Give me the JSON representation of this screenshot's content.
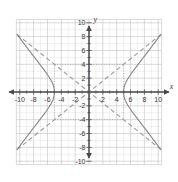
{
  "figure": {
    "kind": "coordinate-plane-graph",
    "background_color": "#ffffff",
    "grid_minor_color": "#e2e2e2",
    "grid_major_color": "#c9c9c9",
    "axis_color": "#4a4a4a",
    "curve_color": "#8a8a8a",
    "asymptote_color": "#9a9a9a",
    "box_color": "#9a9a9a"
  },
  "axes": {
    "x_axis_label": "x",
    "y_axis_label": "y",
    "x_min": -10.5,
    "x_max": 10.5,
    "y_min": -10.5,
    "y_max": 10.5,
    "x_tick_labels": [
      "-10",
      "-8",
      "-6",
      "-4",
      "-2",
      "2",
      "4",
      "6",
      "8",
      "10"
    ],
    "x_tick_values": [
      -10,
      -8,
      -6,
      -4,
      -2,
      2,
      4,
      6,
      8,
      10
    ],
    "y_tick_labels": [
      "10",
      "8",
      "6",
      "4",
      "2",
      "-2",
      "-4",
      "-6",
      "-8",
      "-10"
    ],
    "y_tick_values": [
      10,
      8,
      6,
      4,
      2,
      -2,
      -4,
      -6,
      -8,
      -10
    ],
    "tick_step": 2,
    "grid_step": 1,
    "arrowheads": [
      "left",
      "right",
      "up",
      "down"
    ]
  },
  "chart_data": {
    "type": "line",
    "title": "",
    "xlabel": "x",
    "ylabel": "y",
    "xlim": [
      -10.5,
      10.5
    ],
    "ylim": [
      -10.5,
      10.5
    ],
    "grid": true,
    "legend": "none",
    "equation": "x^2/25 - y^2/16 = 1",
    "conic": "hyperbola",
    "center": [
      0,
      0
    ],
    "a": 5,
    "b": 4,
    "orientation": "horizontal",
    "vertices": [
      [
        -5,
        0
      ],
      [
        5,
        0
      ]
    ],
    "series": [
      {
        "name": "right-branch",
        "style": "solid",
        "points": [
          [
            5,
            0
          ],
          [
            5.05,
            0.57
          ],
          [
            5.2,
            1.12
          ],
          [
            5.45,
            1.64
          ],
          [
            5.8,
            2.21
          ],
          [
            6.25,
            2.87
          ],
          [
            6.8,
            3.6
          ],
          [
            7.4,
            4.38
          ],
          [
            8.1,
            5.3
          ],
          [
            8.9,
            6.35
          ],
          [
            9.8,
            7.53
          ],
          [
            10.4,
            8.33
          ]
        ]
      },
      {
        "name": "right-branch-lower",
        "style": "solid",
        "points": [
          [
            5,
            0
          ],
          [
            5.05,
            -0.57
          ],
          [
            5.2,
            -1.12
          ],
          [
            5.45,
            -1.64
          ],
          [
            5.8,
            -2.21
          ],
          [
            6.25,
            -2.87
          ],
          [
            6.8,
            -3.6
          ],
          [
            7.4,
            -4.38
          ],
          [
            8.1,
            -5.3
          ],
          [
            8.9,
            -6.35
          ],
          [
            9.8,
            -7.53
          ],
          [
            10.4,
            -8.33
          ]
        ]
      },
      {
        "name": "left-branch",
        "style": "solid",
        "points": [
          [
            -5,
            0
          ],
          [
            -5.05,
            0.57
          ],
          [
            -5.2,
            1.12
          ],
          [
            -5.45,
            1.64
          ],
          [
            -5.8,
            2.21
          ],
          [
            -6.25,
            2.87
          ],
          [
            -6.8,
            3.6
          ],
          [
            -7.4,
            4.38
          ],
          [
            -8.1,
            5.3
          ],
          [
            -8.9,
            6.35
          ],
          [
            -9.8,
            7.53
          ],
          [
            -10.4,
            8.33
          ]
        ]
      },
      {
        "name": "left-branch-lower",
        "style": "solid",
        "points": [
          [
            -5,
            0
          ],
          [
            -5.05,
            -0.57
          ],
          [
            -5.2,
            -1.12
          ],
          [
            -5.45,
            -1.64
          ],
          [
            -5.8,
            -2.21
          ],
          [
            -6.25,
            -2.87
          ],
          [
            -6.8,
            -3.6
          ],
          [
            -7.4,
            -4.38
          ],
          [
            -8.1,
            -5.3
          ],
          [
            -8.9,
            -6.35
          ],
          [
            -9.8,
            -7.53
          ],
          [
            -10.4,
            -8.33
          ]
        ]
      },
      {
        "name": "asymptote-positive-slope",
        "style": "dashed",
        "equation": "y = 0.8x",
        "slope": 0.8,
        "points": [
          [
            -10.4,
            -8.32
          ],
          [
            10.4,
            8.32
          ]
        ]
      },
      {
        "name": "asymptote-negative-slope",
        "style": "dashed",
        "equation": "y = -0.8x",
        "slope": -0.8,
        "points": [
          [
            -10.4,
            8.32
          ],
          [
            10.4,
            -8.32
          ]
        ]
      }
    ],
    "central_rectangle": {
      "style": "dotted",
      "x_range": [
        -5,
        5
      ],
      "y_range": [
        -4,
        4
      ],
      "corners": [
        [
          -5,
          4
        ],
        [
          5,
          4
        ],
        [
          5,
          -4
        ],
        [
          -5,
          -4
        ]
      ]
    }
  }
}
